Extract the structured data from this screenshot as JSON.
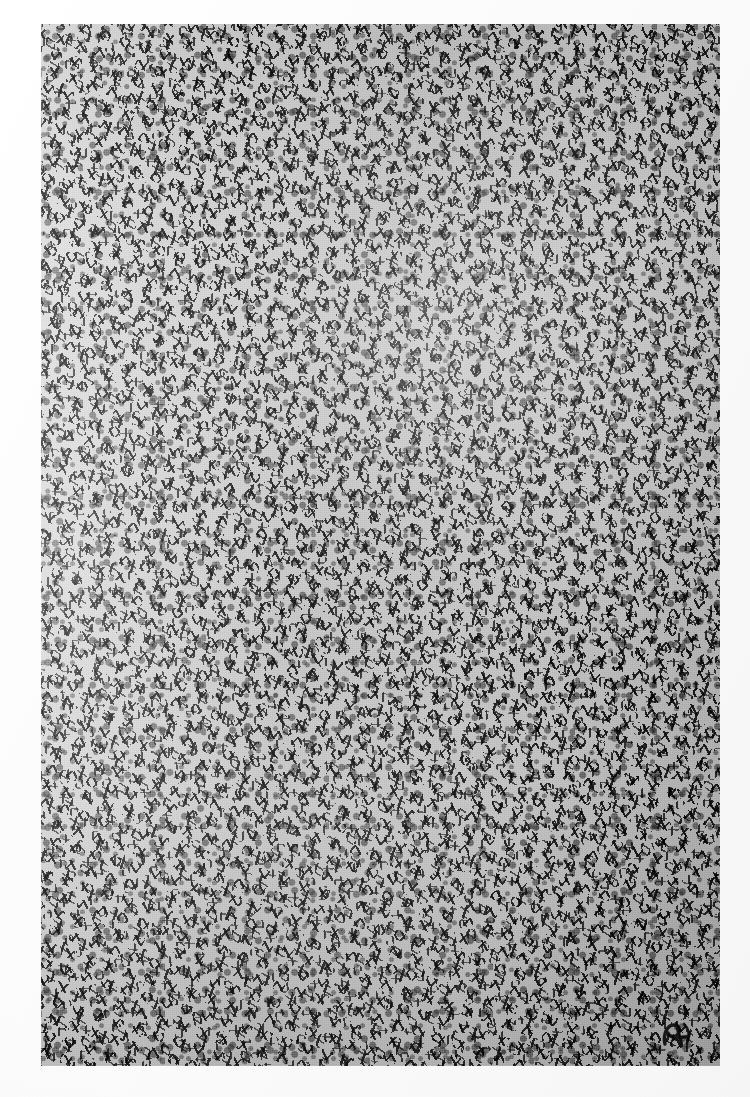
{
  "artwork": {
    "title": "Untitled (allover calligraphic field)",
    "medium": "Black ink / brush on paper, photographic reproduction",
    "orientation": "portrait",
    "composition": "allover",
    "description": "A dense, edge-to-edge field of short black calligraphic strokes, hooks and angular marks laid over a light grey-white ground, with no focal point and no figure-ground hierarchy.",
    "signature": {
      "present": true,
      "label": "artist-monogram",
      "position": "lower-right"
    }
  },
  "plate": {
    "left": 41,
    "top": 24,
    "width": 679,
    "height": 1042,
    "label": "image-plate"
  },
  "margins": {
    "left_label": "left-margin",
    "top_label": "top-margin",
    "right_label": "right-margin",
    "bottom_label": "bottom-margin"
  },
  "palette": {
    "paper": "#fdfdfd",
    "mount": "#f7f7f7",
    "ground_light": "#dedede",
    "ground_mid": "#c8c8c8",
    "ink": "#0a0a0a",
    "ink_soft": "#3a3a3a"
  },
  "tonal_zones": [
    {
      "name": "upper-centre-light-passage",
      "value": "lighter"
    },
    {
      "name": "left-edge-open-passage",
      "value": "lighter"
    },
    {
      "name": "right-edge-dense-passage",
      "value": "darker"
    },
    {
      "name": "lower-right-dense-passage",
      "value": "darker"
    }
  ]
}
